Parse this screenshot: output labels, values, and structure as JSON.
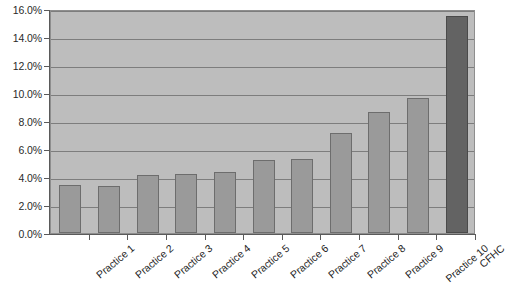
{
  "chart_data": {
    "type": "bar",
    "title": "",
    "subtitle": "",
    "xlabel": "",
    "ylabel": "",
    "categories": [
      "Practice 1",
      "Practice 2",
      "Practice 3",
      "Practice 4",
      "Practice 5",
      "Practice 6",
      "Practice 7",
      "Practice 8",
      "Practice 9",
      "Practice 10",
      "CFHC"
    ],
    "values": [
      3.4,
      3.35,
      4.15,
      4.25,
      4.35,
      5.2,
      5.3,
      7.15,
      8.65,
      9.65,
      15.5
    ],
    "value_labels": [
      "3.4%",
      "3.4%",
      "4.2%",
      "4.3%",
      "4.4%",
      "5.2%",
      "5.3%",
      "7.2%",
      "8.7%",
      "9.7%",
      "15.5%"
    ],
    "ylim": [
      0,
      16
    ],
    "ytick_values": [
      0,
      2,
      4,
      6,
      8,
      10,
      12,
      14,
      16
    ],
    "ytick_labels": [
      "0.0%",
      "2.0%",
      "4.0%",
      "6.0%",
      "8.0%",
      "10.0%",
      "12.0%",
      "14.0%",
      "16.0%"
    ],
    "grid": true,
    "grid_axis": "y",
    "legend": false,
    "legend_position": "none",
    "bar_color": "#9a9a9a",
    "bar_border_color": "#6d6d6d",
    "highlight_color": "#636363",
    "highlight_border_color": "#4a4a4a",
    "highlight_index": 10,
    "plot_background": "#bdbdbd",
    "gridline_color": "#7d7d7d",
    "axis_color": "#5a5a5a",
    "page_background": "#ffffff"
  }
}
